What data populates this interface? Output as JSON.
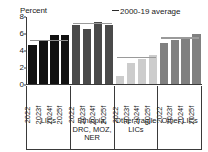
{
  "legend": {
    "label": "2000-19 average",
    "dash_icon": "dashed-line-icon"
  },
  "axis": {
    "unit_label": "Percent"
  },
  "chart_data": {
    "type": "bar",
    "title": "",
    "xlabel": "",
    "ylabel": "Percent",
    "ylim": [
      0,
      8
    ],
    "yticks": [
      0,
      2,
      4,
      6,
      8
    ],
    "grid": false,
    "legend_position": "top-right",
    "categories": [
      "2022",
      "2023f",
      "2024f",
      "2025f"
    ],
    "groups": [
      {
        "name": "LICs",
        "color": "#111111",
        "values": [
          4.7,
          5.2,
          5.9,
          5.9
        ],
        "average_2000_19": 5.2,
        "average_color": "#8d8d8d"
      },
      {
        "name": "Ethiopia, DRC, MOZ, NER",
        "color": "#4a4a4a",
        "values": [
          7.0,
          6.6,
          7.4,
          7.1
        ],
        "average_2000_19": 7.2,
        "average_color": "#9a9a9a"
      },
      {
        "name": "Other fragile LICs",
        "color": "#cccccc",
        "values": [
          1.0,
          2.5,
          3.0,
          3.5
        ],
        "average_2000_19": 3.2,
        "average_color": "#9a9a9a"
      },
      {
        "name": "Other LICs",
        "color": "#808080",
        "values": [
          4.9,
          5.3,
          5.5,
          6.0
        ],
        "average_2000_19": 5.5,
        "average_color": "#9a9a9a"
      }
    ],
    "annotations": [
      "--2000-19 average"
    ]
  }
}
